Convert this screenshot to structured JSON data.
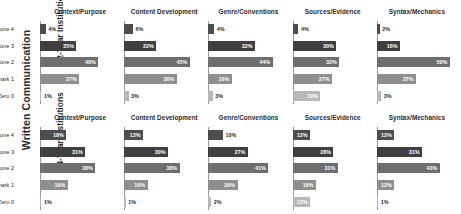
{
  "figure": {
    "outer_label": "Written Communication",
    "row_labels": [
      "2-Year Institutions",
      "4-Year Institutions"
    ],
    "categories": [
      "Capstone 4",
      "Milestone 3",
      "Milestone 2",
      "Benchmark 1",
      "Zero 0"
    ],
    "panel_titles": [
      "Context/Purpose",
      "Content Development",
      "Genre/Conventions",
      "Sources/Evidence",
      "Syntax/Mechanics"
    ],
    "colors": {
      "capstone": "#4d4d4d",
      "milestone3": "#3f3f3f",
      "milestone2": "#6e6e6e",
      "benchmark1": "#8f8f8f",
      "zero0": "#b8b8b8",
      "axis": "#9a9a9a",
      "text": "#2b2b2b",
      "value_text": "#ffffff",
      "background": "#ffffff"
    }
  },
  "chart_data": {
    "type": "bar",
    "title": "Written Communication",
    "xlabel": "",
    "ylabel": "",
    "xlim": [
      0,
      55
    ],
    "grid": false,
    "orientation": "horizontal",
    "categories": [
      "Capstone 4",
      "Milestone 3",
      "Milestone 2",
      "Benchmark 1",
      "Zero 0"
    ],
    "panels": [
      {
        "row": "2-Year Institutions",
        "charts": [
          {
            "title": "Context/Purpose",
            "values": [
              4,
              25,
              40,
              27,
              1
            ],
            "labels": [
              "4%",
              "25%",
              "40%",
              "27%",
              "1%"
            ]
          },
          {
            "title": "Content Development",
            "values": [
              6,
              22,
              45,
              36,
              3
            ],
            "labels": [
              "6%",
              "22%",
              "45%",
              "36%",
              "3%"
            ]
          },
          {
            "title": "Genre/Conventions",
            "values": [
              4,
              32,
              44,
              16,
              3
            ],
            "labels": [
              "4%",
              "32%",
              "44%",
              "16%",
              "3%"
            ]
          },
          {
            "title": "Sources/Evidence",
            "values": [
              4,
              30,
              32,
              27,
              19
            ],
            "labels": [
              "4%",
              "30%",
              "32%",
              "27%",
              "19%"
            ]
          },
          {
            "title": "Syntax/Mechanics",
            "values": [
              2,
              16,
              50,
              27,
              3
            ],
            "labels": [
              "2%",
              "16%",
              "50%",
              "27%",
              "3%"
            ]
          }
        ]
      },
      {
        "row": "4-Year Institutions",
        "charts": [
          {
            "title": "Context/Purpose",
            "values": [
              18,
              31,
              38,
              19,
              1
            ],
            "labels": [
              "18%",
              "31%",
              "38%",
              "19%",
              "1%"
            ]
          },
          {
            "title": "Content Development",
            "values": [
              13,
              30,
              38,
              16,
              1
            ],
            "labels": [
              "13%",
              "30%",
              "38%",
              "16%",
              "1%"
            ]
          },
          {
            "title": "Genre/Conventions",
            "values": [
              10,
              27,
              41,
              20,
              2
            ],
            "labels": [
              "10%",
              "27%",
              "41%",
              "20%",
              "2%"
            ]
          },
          {
            "title": "Sources/Evidence",
            "values": [
              12,
              28,
              31,
              16,
              12
            ],
            "labels": [
              "12%",
              "28%",
              "31%",
              "16%",
              "12%"
            ]
          },
          {
            "title": "Syntax/Mechanics",
            "values": [
              12,
              31,
              43,
              12,
              1
            ],
            "labels": [
              "12%",
              "31%",
              "43%",
              "12%",
              "1%"
            ]
          }
        ]
      }
    ]
  }
}
